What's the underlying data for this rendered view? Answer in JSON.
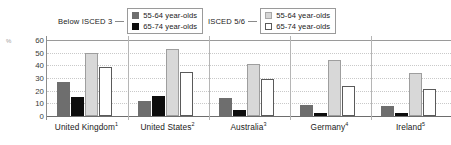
{
  "legend": {
    "groups": [
      {
        "group_label": "Below ISCED 3",
        "entries": [
          {
            "label": "55-64 year-olds",
            "swatch": "dark-gray-filled-square-icon",
            "color": "#6e6e6e"
          },
          {
            "label": "65-74 year-olds",
            "swatch": "black-filled-square-icon",
            "color": "#0d0d0d"
          }
        ]
      },
      {
        "group_label": "ISCED 5/6",
        "entries": [
          {
            "label": "55-64 year-olds",
            "swatch": "light-gray-filled-square-icon",
            "color": "#d8d8d8"
          },
          {
            "label": "65-74 year-olds",
            "swatch": "white-outlined-square-icon",
            "color": "#ffffff"
          }
        ]
      }
    ]
  },
  "axis": {
    "unit_symbol": "%",
    "yticks": [
      "60",
      "50",
      "40",
      "30",
      "20",
      "10",
      "0"
    ]
  },
  "chart_data": {
    "type": "bar",
    "title": "",
    "subtitle": "",
    "xlabel": "",
    "ylabel": "%",
    "ylim": [
      0,
      60
    ],
    "ytick_step": 10,
    "grid": true,
    "legend_position": "top",
    "categories": [
      "United Kingdom¹",
      "United States²",
      "Australia³",
      "Germany⁴",
      "Ireland⁵"
    ],
    "category_plain": [
      "United Kingdom",
      "United States",
      "Australia",
      "Germany",
      "Ireland"
    ],
    "category_footnotes": [
      "1",
      "2",
      "3",
      "4",
      "5"
    ],
    "series": [
      {
        "name": "Below ISCED 3, 55-64 year-olds",
        "group": "Below ISCED 3",
        "age": "55-64 year-olds",
        "color": "#6e6e6e",
        "style": "filled",
        "values": [
          27,
          12,
          14,
          9,
          8
        ]
      },
      {
        "name": "Below ISCED 3, 65-74 year-olds",
        "group": "Below ISCED 3",
        "age": "65-74 year-olds",
        "color": "#0d0d0d",
        "style": "filled",
        "values": [
          15,
          16,
          5,
          2.5,
          2.5
        ]
      },
      {
        "name": "ISCED 5/6, 55-64 year-olds",
        "group": "ISCED 5/6",
        "age": "55-64 year-olds",
        "color": "#d8d8d8",
        "style": "filled-outlined",
        "values": [
          50,
          53,
          41,
          44,
          34
        ]
      },
      {
        "name": "ISCED 5/6, 65-74 year-olds",
        "group": "ISCED 5/6",
        "age": "65-74 year-olds",
        "color": "#ffffff",
        "style": "outlined",
        "values": [
          39,
          35,
          29,
          24,
          21
        ]
      }
    ]
  }
}
